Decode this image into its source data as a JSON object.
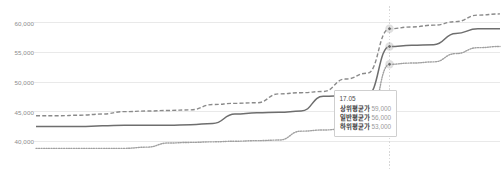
{
  "chart_data": {
    "type": "line",
    "title": "",
    "xlabel": "",
    "ylabel": "",
    "ylim": [
      37000,
      62500
    ],
    "yticks": [
      40000,
      45000,
      50000,
      55000,
      60000
    ],
    "ytick_labels": [
      "40,000",
      "45,000",
      "50,000",
      "55,000",
      "60,000"
    ],
    "grid": true,
    "legend": "none",
    "x": [
      1,
      2,
      3,
      4,
      5,
      6,
      7,
      8,
      9,
      10,
      11,
      12,
      13,
      14,
      15,
      16,
      17,
      18,
      19,
      20,
      21,
      22
    ],
    "highlight_x": 17,
    "highlight_label": "17.05",
    "series": [
      {
        "name": "상위평균가",
        "style": "dashed",
        "color": "#8a8a8a",
        "values": [
          44300,
          44300,
          44400,
          44600,
          45000,
          45100,
          45200,
          45300,
          46200,
          46400,
          46500,
          48000,
          48200,
          48400,
          50500,
          51500,
          59000,
          59300,
          59600,
          60200,
          61300,
          61500
        ],
        "highlight_value": 59000
      },
      {
        "name": "일반평균가",
        "style": "solid",
        "color": "#6e6e6e",
        "values": [
          42500,
          42500,
          42500,
          42600,
          42700,
          42700,
          42700,
          42800,
          43000,
          44600,
          44800,
          44900,
          45100,
          47600,
          47700,
          47800,
          56000,
          56200,
          56300,
          58200,
          59000,
          59000
        ],
        "highlight_value": 56000
      },
      {
        "name": "하위평균가",
        "style": "dotted",
        "color": "#a0a0a0",
        "values": [
          38800,
          38800,
          38800,
          38800,
          38800,
          39000,
          39700,
          39800,
          39900,
          40000,
          40100,
          40200,
          41700,
          41900,
          42100,
          42300,
          53000,
          53200,
          53400,
          54800,
          55800,
          56000
        ],
        "highlight_value": 53000
      }
    ]
  },
  "tooltip": {
    "date": "17.05",
    "rows": [
      {
        "label": "상위평균가",
        "value": "59,000"
      },
      {
        "label": "일반평균가",
        "value": "56,000"
      },
      {
        "label": "하위평균가",
        "value": "53,000"
      }
    ]
  },
  "colors": {
    "grid": "#e9e9e9",
    "axis_text": "#8c8c8c",
    "marker_line": "#d8d8d8",
    "tooltip_border": "#cfcfcf",
    "background": "#ffffff"
  }
}
